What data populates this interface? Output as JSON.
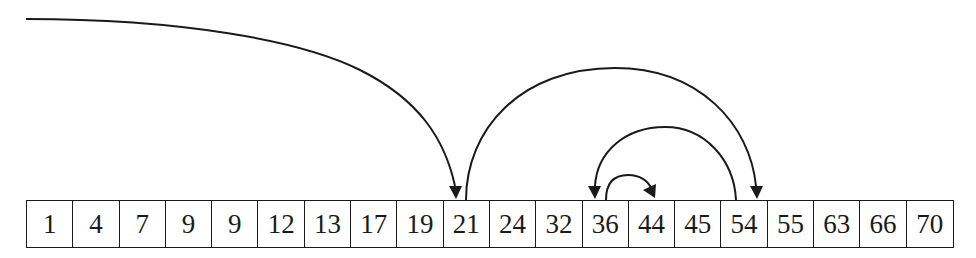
{
  "diagram": {
    "type": "array-search-trace",
    "array": [
      1,
      4,
      7,
      9,
      9,
      12,
      13,
      17,
      19,
      21,
      24,
      32,
      36,
      44,
      45,
      54,
      55,
      63,
      66,
      70
    ],
    "probe_sequence": [
      {
        "from": "entry",
        "to_index": 9,
        "to_value": 21
      },
      {
        "from_index": 9,
        "from_value": 21,
        "to_index": 15,
        "to_value": 54
      },
      {
        "from_index": 15,
        "from_value": 54,
        "to_index": 12,
        "to_value": 36
      },
      {
        "from_index": 12,
        "from_value": 36,
        "to_index": 13,
        "to_value": 44
      }
    ],
    "colors": {
      "stroke": "#1a1a1a",
      "background": "#ffffff"
    }
  }
}
